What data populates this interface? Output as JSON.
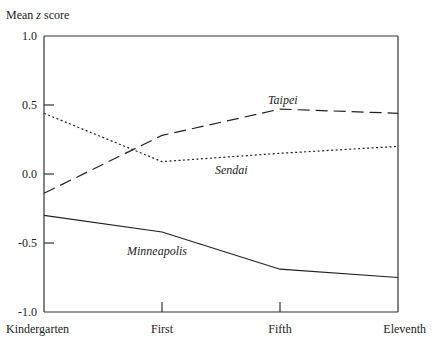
{
  "chart_data": {
    "type": "line",
    "title": "",
    "xlabel": "",
    "ylabel": "Mean z score",
    "ylabel_parts": {
      "pre": "Mean ",
      "var": "z",
      "post": " score"
    },
    "ylim": [
      -1.0,
      1.0
    ],
    "yticks": [
      "1.0",
      "0.5",
      "0.0",
      "-0.5",
      "-1.0"
    ],
    "categories": [
      "Kindergarten",
      "First",
      "Fifth",
      "Eleventh"
    ],
    "grid": false,
    "legend": "inline labels",
    "series": [
      {
        "name": "Taipei",
        "style": "dashed",
        "values": [
          -0.14,
          0.28,
          0.47,
          0.44
        ]
      },
      {
        "name": "Sendai",
        "style": "dotted",
        "values": [
          0.44,
          0.09,
          0.15,
          0.2
        ]
      },
      {
        "name": "Minneapolis",
        "style": "solid",
        "values": [
          -0.3,
          -0.42,
          -0.69,
          -0.75
        ]
      }
    ]
  },
  "labels": {
    "taipei": "Taipei",
    "sendai": "Sendai",
    "minneapolis": "Minneapolis"
  }
}
